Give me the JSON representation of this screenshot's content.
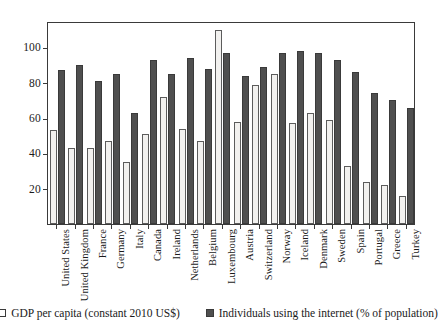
{
  "chart_data": {
    "type": "bar",
    "title": "",
    "subtitle": "",
    "xlabel": "",
    "ylabel": "",
    "ylim": [
      0,
      115
    ],
    "yticks": [
      20,
      40,
      60,
      80,
      100
    ],
    "ytick_labels": [
      "20",
      "40",
      "60",
      "80",
      "100"
    ],
    "grid": false,
    "legend_position": "bottom",
    "categories": [
      "United States",
      "United Kingdom",
      "France",
      "Germany",
      "Italy",
      "Canada",
      "Ireland",
      "Netherlands",
      "Belgium",
      "Luxembourg",
      "Austria",
      "Switzerland",
      "Norway",
      "Iceland",
      "Denmark",
      "Sweden",
      "Spain",
      "Portugal",
      "Greece",
      "Turkey"
    ],
    "series": [
      {
        "name": "GDP per capita (constant 2010 US$)",
        "color": "#f2f1ef",
        "values": [
          53,
          43,
          43,
          47,
          35,
          51,
          72,
          54,
          47,
          110,
          58,
          79,
          85,
          57,
          63,
          59,
          33,
          24,
          22,
          16
        ]
      },
      {
        "name": "Individuals using the internet (% of population)",
        "color": "#4f4f4f",
        "values": [
          87,
          90,
          81,
          85,
          63,
          93,
          85,
          94,
          88,
          97,
          84,
          89,
          97,
          98,
          97,
          93,
          86,
          74,
          70,
          66
        ]
      }
    ]
  },
  "legend": {
    "items": [
      {
        "label": "GDP per capita (constant 2010 US$)",
        "marker": "open-square"
      },
      {
        "label": "Individuals using the internet (% of population)",
        "marker": "filled-square"
      }
    ]
  },
  "axes": {
    "y_tick_labels": [
      "100",
      "80",
      "60",
      "40",
      "20"
    ]
  }
}
